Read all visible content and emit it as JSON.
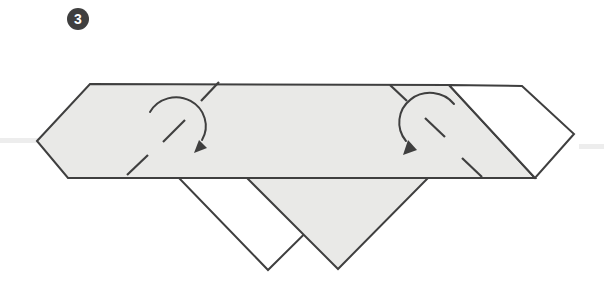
{
  "step": {
    "number": "3"
  },
  "diagram": {
    "description_labels": {
      "left_arrow": "fold-left-corner-inward",
      "right_arrow": "fold-right-corner-inward"
    }
  },
  "colors": {
    "canvas_bg": "#ffffff",
    "paper_fill": "#e9e9e7",
    "paper_white": "#ffffff",
    "outline": "#3f3f3f",
    "badge_bg": "#3f3f3f",
    "badge_fg": "#ffffff",
    "faint_line": "#ededed"
  }
}
